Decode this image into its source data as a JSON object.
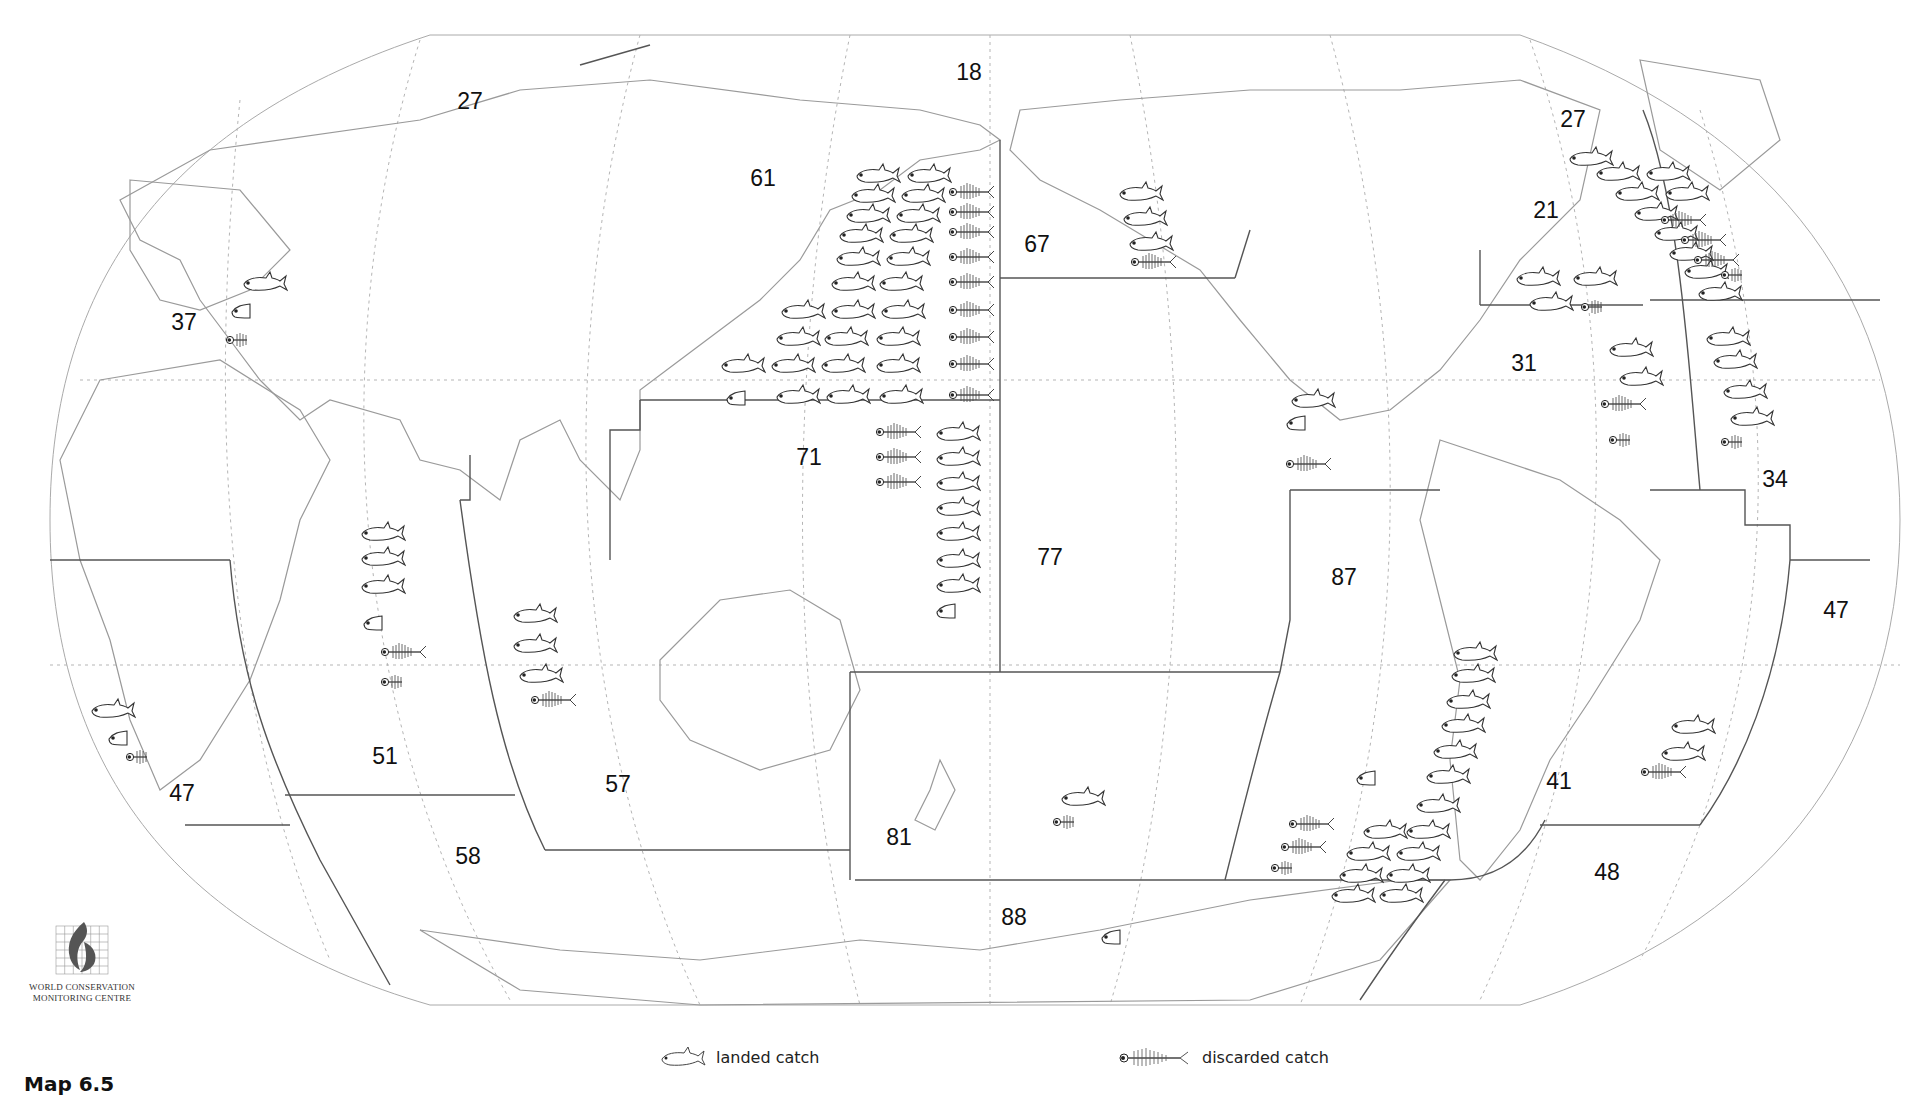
{
  "map": {
    "title": "Map 6.5",
    "projection": "Robinson-like world map, Pacific-centred",
    "boundary_color": "#555555",
    "coast_color": "#9a9a9a",
    "graticule_color": "#b0b0b0"
  },
  "logo": {
    "line1": "WORLD CONSERVATION",
    "line2": "MONITORING CENTRE",
    "icon": "wcmc-logo-icon"
  },
  "legend": {
    "landed": {
      "label": "landed catch",
      "icon": "fish-icon"
    },
    "discarded": {
      "label": "discarded catch",
      "icon": "fish-skeleton-icon"
    }
  },
  "areas": [
    {
      "code": "18",
      "x": 969,
      "y": 72,
      "landed": 0,
      "discarded": 0
    },
    {
      "code": "27",
      "x": 470,
      "y": 101,
      "landed": 0,
      "discarded": 0
    },
    {
      "code": "27",
      "x": 1573,
      "y": 119,
      "landed": 10,
      "discarded": 3.5
    },
    {
      "code": "61",
      "x": 763,
      "y": 178,
      "landed": 25.5,
      "discarded": 9
    },
    {
      "code": "67",
      "x": 1037,
      "y": 244,
      "landed": 3,
      "discarded": 1
    },
    {
      "code": "21",
      "x": 1546,
      "y": 210,
      "landed": 3,
      "discarded": 0.5
    },
    {
      "code": "37",
      "x": 184,
      "y": 322,
      "landed": 1.5,
      "discarded": 0.5
    },
    {
      "code": "31",
      "x": 1524,
      "y": 363,
      "landed": 2,
      "discarded": 1.5
    },
    {
      "code": "71",
      "x": 809,
      "y": 457,
      "landed": 7.5,
      "discarded": 3
    },
    {
      "code": "34",
      "x": 1775,
      "y": 479,
      "landed": 4,
      "discarded": 0.5
    },
    {
      "code": "77",
      "x": 1050,
      "y": 557,
      "landed": 1.5,
      "discarded": 1
    },
    {
      "code": "87",
      "x": 1344,
      "y": 577,
      "landed": 16.5,
      "discarded": 2.5
    },
    {
      "code": "47",
      "x": 1836,
      "y": 610,
      "landed": 0,
      "discarded": 0
    },
    {
      "code": "51",
      "x": 385,
      "y": 756,
      "landed": 3.5,
      "discarded": 1.5
    },
    {
      "code": "57",
      "x": 618,
      "y": 784,
      "landed": 3,
      "discarded": 1
    },
    {
      "code": "41",
      "x": 1559,
      "y": 781,
      "landed": 2,
      "discarded": 1
    },
    {
      "code": "47",
      "x": 182,
      "y": 793,
      "landed": 1.5,
      "discarded": 0.5
    },
    {
      "code": "81",
      "x": 899,
      "y": 837,
      "landed": 1,
      "discarded": 0.5
    },
    {
      "code": "58",
      "x": 468,
      "y": 856,
      "landed": 0,
      "discarded": 0
    },
    {
      "code": "48",
      "x": 1607,
      "y": 872,
      "landed": 0,
      "discarded": 0
    },
    {
      "code": "88",
      "x": 1014,
      "y": 917,
      "landed": 0.3,
      "discarded": 0
    }
  ],
  "icons": {
    "landed": [
      [
        855,
        162
      ],
      [
        906,
        162
      ],
      [
        850,
        182
      ],
      [
        900,
        182
      ],
      [
        845,
        202
      ],
      [
        895,
        202
      ],
      [
        838,
        222
      ],
      [
        888,
        222
      ],
      [
        835,
        245
      ],
      [
        885,
        245
      ],
      [
        830,
        270
      ],
      [
        878,
        270
      ],
      [
        780,
        298
      ],
      [
        830,
        298
      ],
      [
        880,
        298
      ],
      [
        775,
        325
      ],
      [
        823,
        325
      ],
      [
        875,
        325
      ],
      [
        720,
        352
      ],
      [
        770,
        352
      ],
      [
        820,
        352
      ],
      [
        875,
        352
      ],
      [
        775,
        383
      ],
      [
        825,
        383
      ],
      [
        878,
        383
      ],
      [
        935,
        420
      ],
      [
        935,
        445
      ],
      [
        935,
        470
      ],
      [
        935,
        495
      ],
      [
        935,
        520
      ],
      [
        935,
        547
      ],
      [
        935,
        572
      ],
      [
        1118,
        180
      ],
      [
        1122,
        205
      ],
      [
        1128,
        230
      ],
      [
        1568,
        145
      ],
      [
        1595,
        160
      ],
      [
        1645,
        160
      ],
      [
        1614,
        180
      ],
      [
        1664,
        180
      ],
      [
        1633,
        200
      ],
      [
        1653,
        220
      ],
      [
        1668,
        240
      ],
      [
        1683,
        258
      ],
      [
        1697,
        280
      ],
      [
        1515,
        265
      ],
      [
        1572,
        265
      ],
      [
        1528,
        290
      ],
      [
        1608,
        336
      ],
      [
        1618,
        365
      ],
      [
        1705,
        325
      ],
      [
        1712,
        348
      ],
      [
        1722,
        378
      ],
      [
        1729,
        405
      ],
      [
        1290,
        387
      ],
      [
        1452,
        640
      ],
      [
        1450,
        662
      ],
      [
        1445,
        688
      ],
      [
        1440,
        712
      ],
      [
        1432,
        738
      ],
      [
        1425,
        763
      ],
      [
        1415,
        792
      ],
      [
        1405,
        818
      ],
      [
        1362,
        818
      ],
      [
        1345,
        840
      ],
      [
        1395,
        840
      ],
      [
        1338,
        862
      ],
      [
        1385,
        862
      ],
      [
        1330,
        882
      ],
      [
        1378,
        882
      ],
      [
        360,
        520
      ],
      [
        360,
        545
      ],
      [
        360,
        573
      ],
      [
        512,
        602
      ],
      [
        512,
        632
      ],
      [
        518,
        662
      ],
      [
        1670,
        713
      ],
      [
        1660,
        740
      ],
      [
        90,
        697
      ],
      [
        242,
        270
      ],
      [
        1060,
        785
      ]
    ],
    "landed_partial": [
      [
        725,
        385
      ],
      [
        935,
        598
      ],
      [
        362,
        610
      ],
      [
        1285,
        410
      ],
      [
        1355,
        765
      ],
      [
        107,
        725
      ],
      [
        230,
        298
      ],
      [
        1100,
        924
      ]
    ],
    "discarded": [
      [
        948,
        180
      ],
      [
        948,
        200
      ],
      [
        948,
        220
      ],
      [
        948,
        245
      ],
      [
        948,
        270
      ],
      [
        948,
        298
      ],
      [
        948,
        325
      ],
      [
        948,
        352
      ],
      [
        948,
        383
      ],
      [
        875,
        420
      ],
      [
        875,
        445
      ],
      [
        875,
        470
      ],
      [
        1130,
        250
      ],
      [
        1660,
        208
      ],
      [
        1680,
        228
      ],
      [
        1693,
        248
      ],
      [
        1600,
        392
      ],
      [
        380,
        640
      ],
      [
        530,
        688
      ],
      [
        1285,
        452
      ],
      [
        1288,
        812
      ],
      [
        1280,
        835
      ],
      [
        1640,
        760
      ]
    ],
    "discarded_partial": [
      [
        1720,
        263
      ],
      [
        1580,
        295
      ],
      [
        1608,
        428
      ],
      [
        1720,
        430
      ],
      [
        380,
        670
      ],
      [
        225,
        328
      ],
      [
        125,
        745
      ],
      [
        1270,
        856
      ],
      [
        1052,
        810
      ]
    ]
  }
}
